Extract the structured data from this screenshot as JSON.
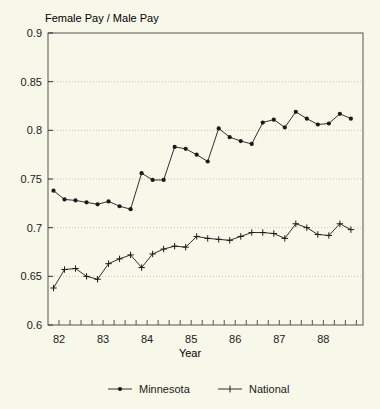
{
  "chart_data": {
    "type": "line",
    "title": "",
    "ylabel": "Female Pay / Male Pay",
    "xlabel": "Year",
    "ylim": [
      0.6,
      0.9
    ],
    "xlim": [
      1981.75,
      1988.9
    ],
    "grid": true,
    "yticks": [
      0.6,
      0.65,
      0.7,
      0.75,
      0.8,
      0.85,
      0.9
    ],
    "ytick_labels": [
      "0.6",
      "0.65",
      "0.7",
      "0.75",
      "0.8",
      "0.85",
      "0.9"
    ],
    "xticks": [
      1982,
      1983,
      1984,
      1985,
      1986,
      1987,
      1988
    ],
    "xtick_labels": [
      "82",
      "83",
      "84",
      "85",
      "86",
      "87",
      "88"
    ],
    "minor_xticks_per_year": 4,
    "legend_position": "bottom",
    "x": [
      1981.875,
      1982.125,
      1982.375,
      1982.625,
      1982.875,
      1983.125,
      1983.375,
      1983.625,
      1983.875,
      1984.125,
      1984.375,
      1984.625,
      1984.875,
      1985.125,
      1985.375,
      1985.625,
      1985.875,
      1986.125,
      1986.375,
      1986.625,
      1986.875,
      1987.125,
      1987.375,
      1987.625,
      1987.875,
      1988.125,
      1988.375,
      1988.625
    ],
    "series": [
      {
        "name": "Minnesota",
        "marker": "filled-circle",
        "color": "#1a1a1a",
        "values": [
          0.738,
          0.729,
          0.728,
          0.726,
          0.724,
          0.727,
          0.722,
          0.719,
          0.756,
          0.749,
          0.749,
          0.783,
          0.781,
          0.775,
          0.768,
          0.802,
          0.793,
          0.789,
          0.786,
          0.808,
          0.811,
          0.803,
          0.819,
          0.812,
          0.806,
          0.807,
          0.817,
          0.812
        ]
      },
      {
        "name": "National",
        "marker": "plus",
        "color": "#1a1a1a",
        "values": [
          0.638,
          0.657,
          0.658,
          0.65,
          0.647,
          0.663,
          0.668,
          0.672,
          0.659,
          0.673,
          0.678,
          0.681,
          0.68,
          0.691,
          0.689,
          0.688,
          0.687,
          0.691,
          0.695,
          0.695,
          0.694,
          0.689,
          0.704,
          0.7,
          0.693,
          0.692,
          0.704,
          0.698
        ]
      }
    ]
  },
  "legend": {
    "items": [
      {
        "label": "Minnesota"
      },
      {
        "label": "National"
      }
    ]
  }
}
